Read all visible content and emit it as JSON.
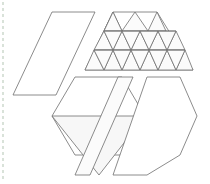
{
  "figure": {
    "canvas": {
      "width": 210,
      "height": 184,
      "background": "#ffffff"
    },
    "stroke_color": "#6e6e6e",
    "fill_color": "#ffffff",
    "tint_color": "#f7f7f7",
    "guide": {
      "name": "left-dashed-guide",
      "color": "#c9d6c9",
      "x": 3,
      "y_start": 2,
      "y_end": 182,
      "dash": "3 3"
    },
    "shapes": [
      {
        "id": "left-parallelogram",
        "label": "Left parallelogram",
        "points": "52,12 95,12 56,95 13,95",
        "fill": "#ffffff"
      },
      {
        "id": "top-trapezoid",
        "label": "Subdivided trapezoid",
        "points": "113,12 157,12 193,70 85,70",
        "fill": "#ffffff"
      },
      {
        "id": "bottom-left-hexagon",
        "label": "Lower-left hexagon",
        "points": "75,77 122,77 145,116 122,155 75,155 52,116",
        "fill": "#ffffff"
      },
      {
        "id": "inner-inverted-triangle",
        "label": "Inverted triangle inside hexagon",
        "points": "52,116 145,116 99,175",
        "fill": "#f7f7f7"
      },
      {
        "id": "narrow-strip-parallelogram",
        "label": "Narrow diagonal strip",
        "points": "118,77 133,77 90,175 75,175",
        "fill": "#fbfbfb"
      },
      {
        "id": "bottom-right-hexagon",
        "label": "Lower-right hexagon",
        "points": "147,77 180,77 197,116 180,155 147,175 113,175",
        "fill": "#ffffff"
      }
    ],
    "trapezoid_grid": {
      "rows": 3,
      "triangle_count": 11,
      "row_y": [
        12,
        31,
        50,
        70
      ],
      "internal_lines": [
        "104,31 176,31",
        "94,50 185,50",
        "113,12 94,50",
        "157,12 185,50",
        "113,12 131,50",
        "157,12 139,50",
        "104,31 85,70",
        "176,31 193,70",
        "122,31 104,70",
        "148,31 167,70",
        "113,50 131,70",
        "158,50 139,70"
      ]
    }
  }
}
